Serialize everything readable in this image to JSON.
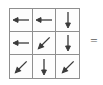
{
  "figure": {
    "type": "vector-field-grid",
    "grid": {
      "rows": 3,
      "cols": 3,
      "border_color": "#8f8f8f",
      "cell_background": "#fdfdfd",
      "arrow_color": "#3a3a3a"
    },
    "cells": [
      {
        "row": 0,
        "col": 0,
        "direction": "left",
        "angle_deg": 180,
        "arrow_icon": "arrow-left-icon"
      },
      {
        "row": 0,
        "col": 1,
        "direction": "left",
        "angle_deg": 180,
        "arrow_icon": "arrow-left-icon"
      },
      {
        "row": 0,
        "col": 2,
        "direction": "down",
        "angle_deg": 270,
        "arrow_icon": "arrow-down-icon"
      },
      {
        "row": 1,
        "col": 0,
        "direction": "left",
        "angle_deg": 180,
        "arrow_icon": "arrow-left-icon"
      },
      {
        "row": 1,
        "col": 1,
        "direction": "down-left",
        "angle_deg": 225,
        "arrow_icon": "arrow-down-left-icon"
      },
      {
        "row": 1,
        "col": 2,
        "direction": "down",
        "angle_deg": 270,
        "arrow_icon": "arrow-down-icon"
      },
      {
        "row": 2,
        "col": 0,
        "direction": "down-left",
        "angle_deg": 225,
        "arrow_icon": "arrow-down-left-icon"
      },
      {
        "row": 2,
        "col": 1,
        "direction": "down",
        "angle_deg": 270,
        "arrow_icon": "arrow-down-icon"
      },
      {
        "row": 2,
        "col": 2,
        "direction": "down-left",
        "angle_deg": 225,
        "arrow_icon": "arrow-down-left-icon"
      }
    ],
    "equals": {
      "label": "=",
      "color": "#5a5a5a"
    }
  },
  "chart_data": {
    "type": "heatmap",
    "title": "",
    "subtitle": "",
    "xlabel": "",
    "ylabel": "",
    "grid": true,
    "legend": "none",
    "rows": 3,
    "cols": 3,
    "categories": [
      "col-0",
      "col-1",
      "col-2"
    ],
    "row_labels": [
      "row-0",
      "row-1",
      "row-2"
    ],
    "series": [
      {
        "name": "row-0",
        "values": [
          180,
          180,
          270
        ]
      },
      {
        "name": "row-1",
        "values": [
          180,
          225,
          270
        ]
      },
      {
        "name": "row-2",
        "values": [
          225,
          270,
          225
        ]
      }
    ],
    "value_unit": "degrees",
    "value_description": "arrow heading, 0 = right, counter-clockwise",
    "annotations": [
      "="
    ]
  }
}
